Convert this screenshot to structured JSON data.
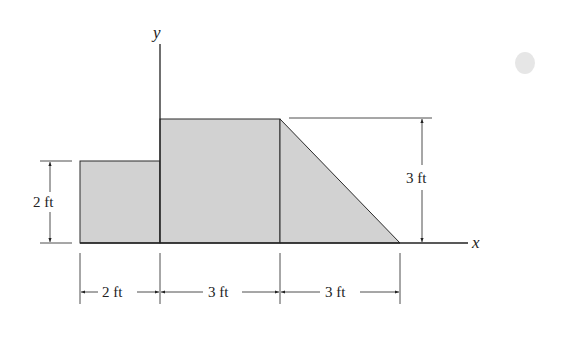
{
  "figure": {
    "axes": {
      "x_label": "x",
      "y_label": "y"
    },
    "shapes": [
      {
        "name": "left-rectangle",
        "width_ft": 2,
        "height_ft": 2
      },
      {
        "name": "middle-rectangle",
        "width_ft": 3,
        "height_ft": 3
      },
      {
        "name": "right-triangle",
        "base_ft": 3,
        "height_ft": 3
      }
    ],
    "dimensions": {
      "left_height": "2 ft",
      "right_height": "3 ft",
      "bottom": [
        "2 ft",
        "3 ft",
        "3 ft"
      ]
    },
    "colors": {
      "fill": "#d2d2d2",
      "stroke": "#2a2a2a",
      "background": "#ffffff"
    }
  }
}
